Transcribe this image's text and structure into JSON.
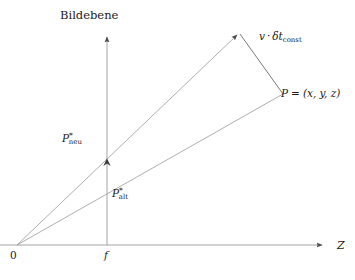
{
  "figure": {
    "background_color": "#ffffff",
    "line_color": "#9a9a9a",
    "text_color": "#1a1a1a"
  },
  "labels": {
    "plane_title": "Bildebene",
    "origin": "0",
    "focal_length": "f",
    "z_axis": "Z",
    "velocity": {
      "v": "v",
      "dot": "·",
      "delta_t": "δt",
      "subscript": "const"
    },
    "point_p": {
      "name": "P",
      "equals": "=",
      "coordinates": "(x, y, z)"
    },
    "p_neu": {
      "base": "P",
      "superscript": "*",
      "subscript": "neu"
    },
    "p_alt": {
      "base": "P",
      "superscript": "*",
      "subscript": "alt"
    }
  },
  "geometry": {
    "origin": {
      "x": 17,
      "y": 245
    },
    "image_plane_axis": {
      "x": 107,
      "y_top": 35,
      "y_bottom": 245
    },
    "z_axis": {
      "y": 245,
      "x_start": 0,
      "x_end": 325
    },
    "point_p": {
      "x": 283,
      "y": 94
    },
    "point_p_displaced": {
      "x": 239,
      "y": 33
    },
    "projection_new": {
      "x": 107,
      "y": 160
    },
    "projection_old": {
      "x": 107,
      "y": 183
    }
  }
}
